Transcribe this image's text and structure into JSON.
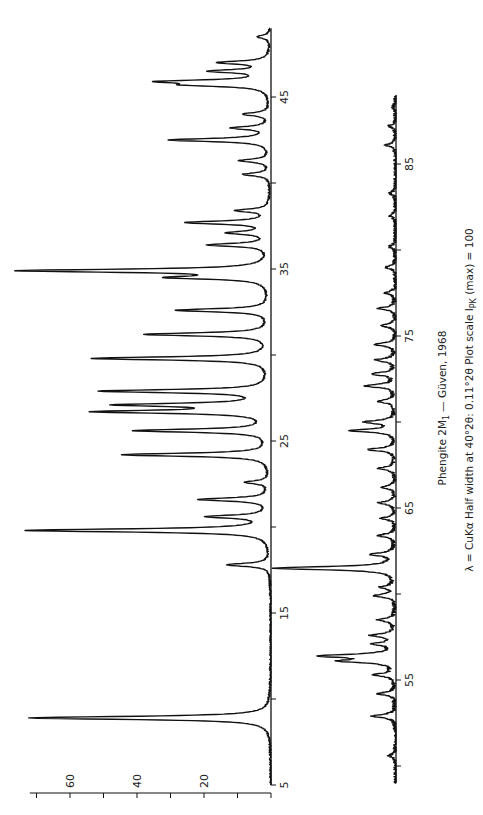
{
  "figure": {
    "title_main": "Phengite 2M",
    "title_sub": "1",
    "title_rest": "— Güven, 1968",
    "subtitle_prefix": "λ = CuKα  Half width at 40°2θ: 0.11°2θ    Plot scale I",
    "subtitle_sub": "PK",
    "subtitle_suffix": " (max) = 100",
    "orientation": "rotated 90° counter-clockwise",
    "line_color": "#111111"
  },
  "chart_data": [
    {
      "type": "line",
      "title": "Phengite 2M1 — Güven, 1968 (5–49°2θ)",
      "xlabel": "2θ (degrees)",
      "ylabel": "Intensity (I/Imax × 100)",
      "xlim": [
        5,
        49
      ],
      "ylim": [
        0,
        75
      ],
      "x_ticks": [
        5,
        15,
        25,
        35,
        45
      ],
      "y_ticks": [
        20,
        40,
        60
      ],
      "grid": false,
      "peaks": [
        {
          "two_theta": 8.9,
          "intensity": 72
        },
        {
          "two_theta": 17.8,
          "intensity": 13
        },
        {
          "two_theta": 19.8,
          "intensity": 73
        },
        {
          "two_theta": 20.6,
          "intensity": 18
        },
        {
          "two_theta": 21.6,
          "intensity": 21
        },
        {
          "two_theta": 22.6,
          "intensity": 7
        },
        {
          "two_theta": 24.2,
          "intensity": 44
        },
        {
          "two_theta": 25.6,
          "intensity": 40
        },
        {
          "two_theta": 26.7,
          "intensity": 50
        },
        {
          "two_theta": 27.1,
          "intensity": 43
        },
        {
          "two_theta": 27.9,
          "intensity": 50
        },
        {
          "two_theta": 29.8,
          "intensity": 53
        },
        {
          "two_theta": 31.2,
          "intensity": 37
        },
        {
          "two_theta": 32.6,
          "intensity": 28
        },
        {
          "two_theta": 34.5,
          "intensity": 27
        },
        {
          "two_theta": 34.9,
          "intensity": 74
        },
        {
          "two_theta": 36.4,
          "intensity": 18
        },
        {
          "two_theta": 37.1,
          "intensity": 12
        },
        {
          "two_theta": 37.7,
          "intensity": 25
        },
        {
          "two_theta": 38.4,
          "intensity": 10
        },
        {
          "two_theta": 40.5,
          "intensity": 8
        },
        {
          "two_theta": 41.3,
          "intensity": 9
        },
        {
          "two_theta": 42.5,
          "intensity": 30
        },
        {
          "two_theta": 43.2,
          "intensity": 11
        },
        {
          "two_theta": 44.0,
          "intensity": 8
        },
        {
          "two_theta": 45.7,
          "intensity": 20
        },
        {
          "two_theta": 45.9,
          "intensity": 30
        },
        {
          "two_theta": 46.5,
          "intensity": 17
        },
        {
          "two_theta": 47.0,
          "intensity": 15
        },
        {
          "two_theta": 48.5,
          "intensity": 4
        }
      ]
    },
    {
      "type": "line",
      "title": "Phengite 2M1 — Güven, 1968 (49–89°2θ)",
      "xlabel": "2θ (degrees)",
      "ylabel": "Intensity (I/Imax × 100)",
      "xlim": [
        49,
        89
      ],
      "ylim": [
        0,
        40
      ],
      "x_ticks": [
        55,
        65,
        75,
        85
      ],
      "grid": false,
      "peaks": [
        {
          "two_theta": 50.6,
          "intensity": 2
        },
        {
          "two_theta": 52.9,
          "intensity": 7
        },
        {
          "two_theta": 54.2,
          "intensity": 5
        },
        {
          "two_theta": 55.3,
          "intensity": 6
        },
        {
          "two_theta": 56.1,
          "intensity": 15
        },
        {
          "two_theta": 56.4,
          "intensity": 22
        },
        {
          "two_theta": 57.1,
          "intensity": 6
        },
        {
          "two_theta": 57.6,
          "intensity": 7
        },
        {
          "two_theta": 58.5,
          "intensity": 5
        },
        {
          "two_theta": 59.9,
          "intensity": 6
        },
        {
          "two_theta": 60.4,
          "intensity": 4
        },
        {
          "two_theta": 61.5,
          "intensity": 36
        },
        {
          "two_theta": 62.3,
          "intensity": 7
        },
        {
          "two_theta": 63.4,
          "intensity": 5
        },
        {
          "two_theta": 64.4,
          "intensity": 4
        },
        {
          "two_theta": 65.3,
          "intensity": 5
        },
        {
          "two_theta": 66.2,
          "intensity": 4
        },
        {
          "two_theta": 67.3,
          "intensity": 5
        },
        {
          "two_theta": 68.4,
          "intensity": 8
        },
        {
          "two_theta": 69.5,
          "intensity": 13
        },
        {
          "two_theta": 70.0,
          "intensity": 9
        },
        {
          "two_theta": 71.2,
          "intensity": 5
        },
        {
          "two_theta": 72.1,
          "intensity": 9
        },
        {
          "two_theta": 72.8,
          "intensity": 7
        },
        {
          "two_theta": 73.6,
          "intensity": 6
        },
        {
          "two_theta": 74.5,
          "intensity": 6
        },
        {
          "two_theta": 75.6,
          "intensity": 4
        },
        {
          "two_theta": 76.6,
          "intensity": 5
        },
        {
          "two_theta": 77.5,
          "intensity": 3
        },
        {
          "two_theta": 79.0,
          "intensity": 3
        },
        {
          "two_theta": 80.2,
          "intensity": 2
        },
        {
          "two_theta": 82.0,
          "intensity": 2
        },
        {
          "two_theta": 83.3,
          "intensity": 2
        },
        {
          "two_theta": 86.1,
          "intensity": 3
        },
        {
          "two_theta": 87.2,
          "intensity": 2
        },
        {
          "two_theta": 88.3,
          "intensity": 1
        }
      ]
    }
  ],
  "axes": {
    "top": {
      "x_tick_labels": [
        "5",
        "15",
        "25",
        "35",
        "45"
      ],
      "y_tick_labels": [
        "20",
        "40",
        "60"
      ]
    },
    "bottom": {
      "x_tick_labels": [
        "55",
        "65",
        "75",
        "85"
      ]
    }
  }
}
